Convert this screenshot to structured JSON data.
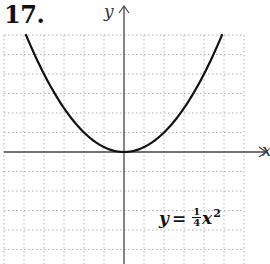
{
  "problem": {
    "number": "17."
  },
  "axes": {
    "x_label": "x",
    "y_label": "y"
  },
  "equation": {
    "lhs": "y",
    "eq": "=",
    "num": "1",
    "den": "4",
    "var": "x",
    "exp": "2"
  },
  "colors": {
    "curve": "#111111",
    "axis": "#444444",
    "grid": "#b0b0b0"
  },
  "chart_data": {
    "type": "line",
    "title": "17.",
    "xlabel": "x",
    "ylabel": "y",
    "function": "y = (1/4)x^2",
    "xlim": [
      -6,
      6
    ],
    "ylim": [
      -6,
      6
    ],
    "grid": true,
    "grid_style": "dotted",
    "x": [
      -4.9,
      -4,
      -3,
      -2,
      -1,
      0,
      1,
      2,
      3,
      4,
      4.9
    ],
    "y": [
      6.0,
      4,
      2.25,
      1,
      0.25,
      0,
      0.25,
      1,
      2.25,
      4,
      6.0
    ],
    "annotations": [
      "y = ¼x²"
    ]
  }
}
